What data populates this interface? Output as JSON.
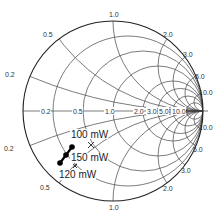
{
  "chart": {
    "type": "smith-chart",
    "center": [
      113,
      111
    ],
    "radius": 90,
    "resistance_circles": [
      0.2,
      0.5,
      1.0,
      2.0,
      3.0,
      5.0,
      10.0
    ],
    "reactance_arcs": [
      0.2,
      0.5,
      1.0,
      2.0,
      3.0,
      5.0,
      10.0
    ],
    "axis_labels": [
      "0.2",
      "0.5",
      "1.0",
      "2.0",
      "3.0",
      "5.0",
      "10.0"
    ],
    "outer_labels_top": {
      "x0_2": "0.2",
      "x0_5": "0.5",
      "x1_0": "1.0",
      "x2_0": "2.0",
      "x3_0": "3.0",
      "x5_0": "5.0",
      "x10_0": "10.0"
    },
    "outer_labels_bottom": {
      "x0_2": "0.2",
      "x0_5": "0.5",
      "x1_0": "1.0",
      "x2_0": "2.0",
      "x3_0": "3.0",
      "x5_0": "5.0",
      "x10_0": "10.0"
    },
    "axis": {
      "r0_2": "0.2",
      "r0_5": "0.5",
      "r1_0": "1.0",
      "r2_0": "2.0",
      "r3_0": "3.0",
      "r5_0": "5.0",
      "r10_0": "10.0"
    }
  },
  "annotations": {
    "p100": "100 mW",
    "p150": "150 mW",
    "p120": "120 mW"
  },
  "trace_points": [
    [
      72,
      147
    ],
    [
      66,
      155
    ],
    [
      60,
      163
    ]
  ],
  "markers": [
    [
      91,
      145
    ],
    [
      75,
      166
    ]
  ]
}
